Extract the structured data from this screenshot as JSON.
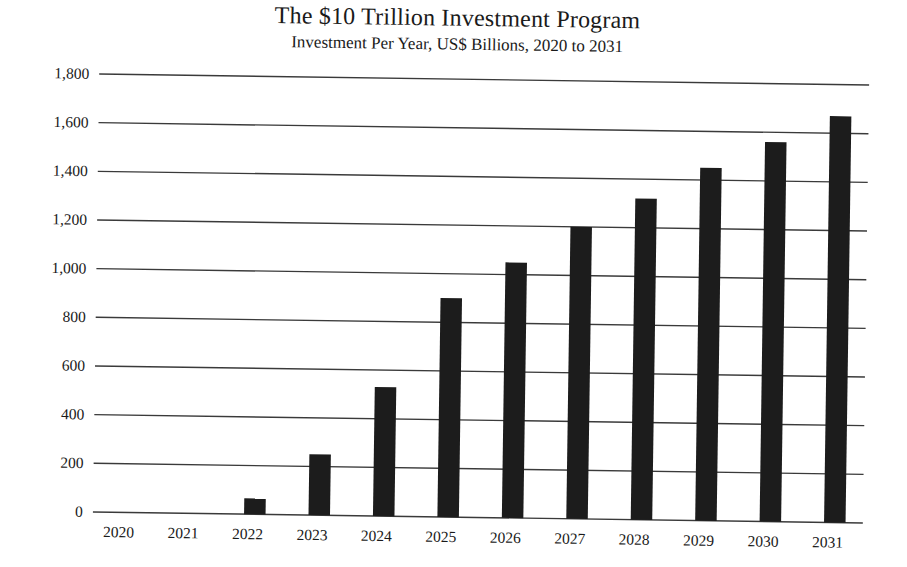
{
  "chart_data": {
    "type": "bar",
    "title": "The $10 Trillion Investment Program",
    "subtitle": "Investment Per Year, US$ Billions, 2020 to 2031",
    "xlabel": "",
    "ylabel": "",
    "categories": [
      "2020",
      "2021",
      "2022",
      "2023",
      "2024",
      "2025",
      "2026",
      "2027",
      "2028",
      "2029",
      "2030",
      "2031"
    ],
    "values": [
      0,
      0,
      65,
      250,
      530,
      900,
      1050,
      1200,
      1320,
      1450,
      1560,
      1670
    ],
    "ylim": [
      0,
      1800
    ],
    "yticks": [
      0,
      200,
      400,
      600,
      800,
      1000,
      1200,
      1400,
      1600,
      1800
    ],
    "ytick_labels": [
      "0",
      "200",
      "400",
      "600",
      "800",
      "1,000",
      "1,200",
      "1,400",
      "1,600",
      "1,800"
    ],
    "grid": true,
    "legend": null,
    "colors": {
      "bar": "#1c1c1c",
      "gridline": "#3a3a3a",
      "text": "#1a1a1a",
      "background": "#ffffff"
    }
  }
}
